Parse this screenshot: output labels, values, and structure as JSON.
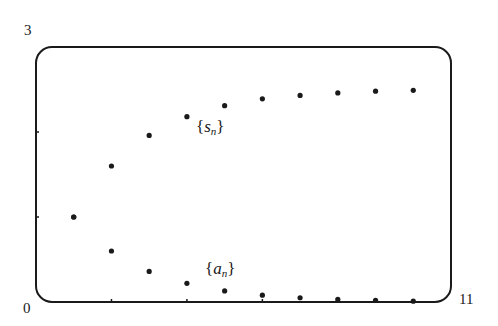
{
  "chart_data": {
    "type": "scatter",
    "title": "",
    "xlabel": "",
    "ylabel": "",
    "xlim": [
      0,
      11
    ],
    "ylim": [
      0,
      3
    ],
    "grid": false,
    "legend": "inline labels",
    "x_tick_labels": [
      "0",
      "11"
    ],
    "y_tick_labels": [
      "0",
      "3"
    ],
    "x": [
      1,
      2,
      3,
      4,
      5,
      6,
      7,
      8,
      9,
      10
    ],
    "series": [
      {
        "name": "{s_n}",
        "label_var": "s",
        "label_sub": "n",
        "values": [
          1.0,
          1.6,
          1.96,
          2.18,
          2.31,
          2.39,
          2.43,
          2.46,
          2.48,
          2.49
        ]
      },
      {
        "name": "{a_n}",
        "label_var": "a",
        "label_sub": "n",
        "values": [
          1.0,
          0.6,
          0.36,
          0.22,
          0.13,
          0.08,
          0.05,
          0.03,
          0.02,
          0.01
        ]
      }
    ],
    "y_ticks_marks": [
      1,
      2
    ],
    "x_ticks_marks": [
      2,
      4,
      6,
      8,
      10
    ]
  },
  "labels": {
    "origin": "0",
    "y_max": "3",
    "x_max": "11",
    "brace_open": "{",
    "brace_close": "}"
  },
  "colors": {
    "ink": "#1a1a1a",
    "background": "#ffffff"
  }
}
